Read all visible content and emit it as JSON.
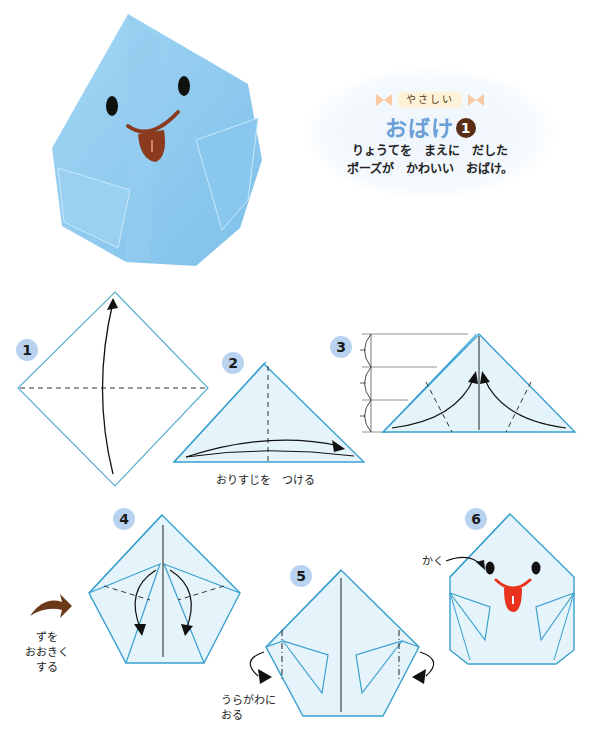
{
  "header": {
    "difficulty_label": "やさしい",
    "title": "おばけ",
    "title_number": "1",
    "description_line1": "りょうてを　まえに　だした",
    "description_line2": "ポーズが　かわいい　おばけ。"
  },
  "photo": {
    "subject": "origami-ghost-photo",
    "paper_color": "#8cc8ee",
    "mouth_color": "#8b3a1e"
  },
  "steps": [
    {
      "number": "1",
      "instruction": ""
    },
    {
      "number": "2",
      "instruction": "おりすじを　つける"
    },
    {
      "number": "3",
      "instruction": ""
    },
    {
      "number": "4",
      "instruction": ""
    },
    {
      "number": "5",
      "instruction": "うらがわに\nおる",
      "instruction_line1": "うらがわに",
      "instruction_line2": "おる"
    },
    {
      "number": "6",
      "instruction": "かく"
    }
  ],
  "enlarge_note": {
    "line1": "ずを",
    "line2": "おおきく",
    "line3": "する"
  },
  "colors": {
    "outline": "#3aa0d0",
    "fill": "#e4f4fa",
    "step_badge": "#b8d2ef",
    "title_blue": "#6a9fd8",
    "arrow_brown": "#6b3a1a",
    "tongue_red": "#e8321e"
  }
}
